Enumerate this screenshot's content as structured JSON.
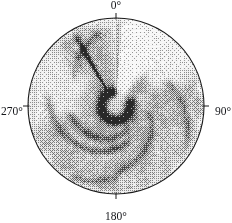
{
  "figure": {
    "kind": "polar-ppi-plot",
    "background_color": "#ffffff",
    "ink_color": "#15161a"
  },
  "polar_axes": {
    "center_x": 116,
    "center_y": 106,
    "radius": 88,
    "outline_color": "#1a1a1a",
    "outline_width": 1.1,
    "tick_length": 5,
    "azimuth_labels": [
      {
        "name": "az-0",
        "text": "0°",
        "angle_deg": 0
      },
      {
        "name": "az-90",
        "text": "90°",
        "angle_deg": 90
      },
      {
        "name": "az-180",
        "text": "180°",
        "angle_deg": 180
      },
      {
        "name": "az-270",
        "text": "270°",
        "angle_deg": 270
      }
    ]
  },
  "chart_data": {
    "type": "heatmap",
    "projection": "polar",
    "title": "",
    "subtitle": "",
    "xlabel": "",
    "ylabel": "",
    "grid": false,
    "legend": false,
    "colormap": "grayscale-inverted",
    "colormap_note": "dark = high value, white = low value; rendered with halftone dither",
    "theta_label_unit": "degrees",
    "theta_tick_labels": [
      "0°",
      "90°",
      "180°",
      "270°"
    ],
    "theta_ticks_deg": [
      0,
      90,
      180,
      270
    ],
    "theta_range_deg": [
      0,
      360
    ],
    "r_range_norm": [
      0,
      1
    ],
    "background_level": 0.3,
    "features": [
      {
        "name": "eyewall-ring",
        "shape": "annulus",
        "r_center_norm": 0.165,
        "r_width_norm": 0.075,
        "theta_center_deg": 215,
        "theta_span_deg": 300,
        "intensity": 0.92,
        "note": "dark open horseshoe ring around centre, gap toward 0-20 deg"
      },
      {
        "name": "eye-clear-region",
        "shape": "disk",
        "r_norm": 0.095,
        "intensity": 0.22,
        "note": "weak reflectivity inside the ring"
      },
      {
        "name": "north-clear-wedge",
        "shape": "wedge",
        "theta_center_deg": 18,
        "theta_span_deg": 34,
        "r_inner_norm": 0.1,
        "r_outer_norm": 1.0,
        "intensity": 0.04,
        "note": "bright white sector running north from the eye"
      },
      {
        "name": "northeast-bright-region",
        "shape": "wedge",
        "theta_center_deg": 44,
        "theta_span_deg": 40,
        "r_inner_norm": 0.45,
        "r_outer_norm": 1.0,
        "intensity": 0.08
      },
      {
        "name": "west-clear-region",
        "shape": "wedge",
        "theta_center_deg": 285,
        "theta_span_deg": 48,
        "r_inner_norm": 0.4,
        "r_outer_norm": 0.95,
        "intensity": 0.12
      },
      {
        "name": "northwest-radial-spoke",
        "shape": "ray",
        "theta_deg": 330,
        "width_deg": 2.6,
        "r_inner_norm": 0.16,
        "r_outer_norm": 0.92,
        "intensity": 0.78,
        "note": "dark narrow radial streak artifact"
      },
      {
        "name": "north-radial-spoke",
        "shape": "ray",
        "theta_deg": 2,
        "width_deg": 1.6,
        "r_inner_norm": 0.12,
        "r_outer_norm": 0.95,
        "intensity": 0.45,
        "note": "faint dotted radial line along the 0 degree azimuth"
      },
      {
        "name": "southwest-spiral-band-outer",
        "shape": "spiral-arc",
        "theta_start_deg": 150,
        "theta_end_deg": 285,
        "r_start_norm": 0.4,
        "r_end_norm": 0.8,
        "intensity": 0.62
      },
      {
        "name": "southwest-spiral-band-inner",
        "shape": "spiral-arc",
        "theta_start_deg": 140,
        "theta_end_deg": 270,
        "r_start_norm": 0.26,
        "r_end_norm": 0.55,
        "intensity": 0.58
      },
      {
        "name": "southeast-spiral-band",
        "shape": "spiral-arc",
        "theta_start_deg": 95,
        "theta_end_deg": 185,
        "r_start_norm": 0.35,
        "r_end_norm": 0.78,
        "intensity": 0.5
      },
      {
        "name": "east-outer-band",
        "shape": "spiral-arc",
        "theta_start_deg": 60,
        "theta_end_deg": 125,
        "r_start_norm": 0.62,
        "r_end_norm": 0.94,
        "intensity": 0.46
      },
      {
        "name": "south-outer-band",
        "shape": "spiral-arc",
        "theta_start_deg": 175,
        "theta_end_deg": 215,
        "r_start_norm": 0.8,
        "r_end_norm": 0.96,
        "intensity": 0.42
      },
      {
        "name": "northwest-outer-band",
        "shape": "spiral-arc",
        "theta_start_deg": 300,
        "theta_end_deg": 352,
        "r_start_norm": 0.55,
        "r_end_norm": 0.88,
        "intensity": 0.4
      }
    ]
  }
}
